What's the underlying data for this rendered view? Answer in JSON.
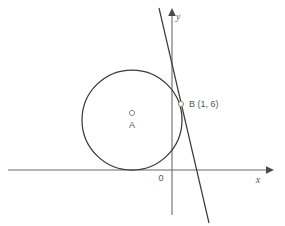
{
  "figure": {
    "background_color": "#ffffff",
    "stroke_color": "#3a3a3a",
    "axis_color": "#6b6b6b",
    "label_color": "#555555"
  },
  "axes": {
    "x_axis": {
      "label": "x",
      "label_x": 258,
      "label_y": 183,
      "line_x1": 8,
      "line_y1": 170,
      "line_x2": 266,
      "line_y2": 170,
      "arrow_points": "266,166.2 274,170 266,173.8"
    },
    "y_axis": {
      "label": "y",
      "label_x": 176,
      "label_y": 20,
      "line_x1": 172,
      "line_y1": 16,
      "line_x2": 172,
      "line_y2": 215,
      "arrow_points": "168.2,16 172,8 175.8,16"
    },
    "origin": {
      "label": "0",
      "label_x": 161,
      "label_y": 181
    }
  },
  "circle": {
    "center_x": 132,
    "center_y": 120,
    "radius": 50,
    "tangent_to": "x-axis"
  },
  "points": [
    {
      "id": "A",
      "label": "A",
      "role": "center",
      "marker_x": 132,
      "marker_y": 113,
      "marker_r": 2.6,
      "label_x": 132,
      "label_y": 128
    },
    {
      "id": "B",
      "label": "B (1, 6)",
      "role": "tangency-point",
      "marker_x": 181,
      "marker_y": 104,
      "marker_r": 2.6,
      "label_x": 189,
      "label_y": 107
    }
  ],
  "tangent_line": {
    "name": "tangent-at-B",
    "x1": 159,
    "y1": 8,
    "x2": 209,
    "y2": 223
  }
}
